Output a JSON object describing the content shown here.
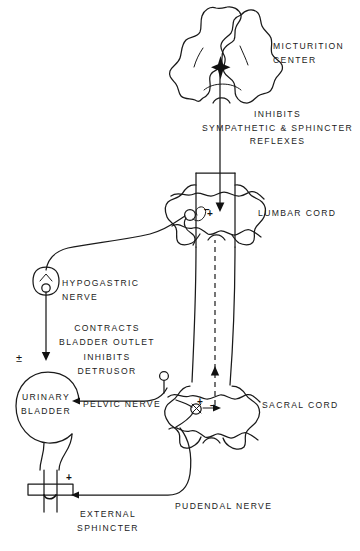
{
  "figure": {
    "background_color": "#ffffff",
    "ink_color": "#1a1a1a"
  },
  "labels": {
    "micturition_center": "MICTURITION\nCENTER",
    "inhibits_reflexes": "INHIBITS\nSYMPATHETIC & SPHINCTER\nREFLEXES",
    "lumbar_cord": "LUMBAR CORD",
    "hypogastric_nerve": "HYPOGASTRIC\nNERVE",
    "contracts_outlet": "CONTRACTS\nBLADDER OUTLET",
    "inhibits_detrusor": "INHIBITS\nDETRUSOR",
    "urinary_bladder": "URINARY\nBLADDER",
    "pelvic_nerve": "PELVIC NERVE",
    "sacral_cord": "SACRAL CORD",
    "external_sphincter": "EXTERNAL\nSPHINCTER",
    "pudendal_nerve": "PUDENDAL NERVE"
  },
  "signs": {
    "lumbar_minus": "−",
    "lumbar_plus": "+",
    "detrusor_plusminus": "±",
    "sacral_plus": "+",
    "sacral_minus": "−",
    "sphincter_plus": "+"
  },
  "icons": {
    "brainstem": "brainstem-cross-section-icon",
    "lumbar_cord_section": "spinal-cord-cross-section-icon",
    "sacral_cord_section": "spinal-cord-cross-section-icon",
    "ganglion": "ganglion-icon",
    "bladder": "bladder-icon",
    "sphincter": "sphincter-icon",
    "star_marker": "star-marker-icon",
    "arrow_up": "arrow-up-icon",
    "arrow_down": "arrow-down-icon"
  }
}
